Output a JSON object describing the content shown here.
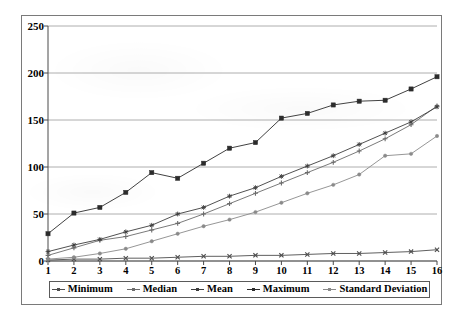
{
  "chart_data": {
    "type": "line",
    "title": "",
    "subtitle": "",
    "xlabel": "",
    "ylabel": "",
    "xlim": [
      1,
      16
    ],
    "ylim": [
      0,
      250
    ],
    "yticks": [
      0,
      50,
      100,
      150,
      200,
      250
    ],
    "grid": true,
    "legend_position": "bottom",
    "categories": [
      1,
      2,
      3,
      4,
      5,
      6,
      7,
      8,
      9,
      10,
      11,
      12,
      13,
      14,
      15,
      16
    ],
    "series": [
      {
        "name": "Minimum",
        "color": "#4d4d4d",
        "marker": "cross",
        "values": [
          1,
          2,
          2,
          3,
          3,
          4,
          5,
          5,
          6,
          6,
          7,
          8,
          8,
          9,
          10,
          12
        ]
      },
      {
        "name": "Median",
        "color": "#6b6b6b",
        "marker": "plus",
        "values": [
          6,
          14,
          22,
          26,
          33,
          40,
          50,
          61,
          72,
          83,
          94,
          105,
          117,
          130,
          145,
          165
        ]
      },
      {
        "name": "Mean",
        "color": "#3d3d3d",
        "marker": "star",
        "values": [
          10,
          17,
          23,
          31,
          38,
          50,
          57,
          69,
          78,
          90,
          101,
          112,
          124,
          136,
          148,
          164
        ]
      },
      {
        "name": "Maximum",
        "color": "#2b2b2b",
        "marker": "square",
        "values": [
          29,
          51,
          57,
          73,
          94,
          88,
          104,
          120,
          126,
          152,
          157,
          166,
          170,
          171,
          183,
          196
        ]
      },
      {
        "name": "Standard Deviation",
        "color": "#8a8a8a",
        "marker": "dot",
        "values": [
          2,
          4,
          8,
          13,
          21,
          29,
          37,
          44,
          52,
          62,
          72,
          81,
          92,
          112,
          114,
          133
        ]
      }
    ]
  },
  "axes": {
    "y_tick_labels": [
      "250",
      "200",
      "150",
      "100",
      "50",
      "0"
    ],
    "x_tick_labels": [
      "1",
      "2",
      "3",
      "4",
      "5",
      "6",
      "7",
      "8",
      "9",
      "10",
      "11",
      "12",
      "13",
      "14",
      "15",
      "16"
    ]
  },
  "legend": {
    "items": [
      {
        "label": "Minimum"
      },
      {
        "label": "Median"
      },
      {
        "label": "Mean"
      },
      {
        "label": "Maximum"
      },
      {
        "label": "Standard Deviation"
      }
    ]
  },
  "colors": {
    "gridline": "#9a9a9a",
    "axis": "#4a4a4a",
    "frame": "#7a7a7a",
    "background": "#ffffff"
  }
}
